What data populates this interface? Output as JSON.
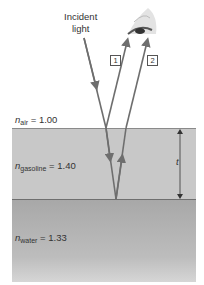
{
  "diagram": {
    "incident_label": [
      "Incident",
      "light"
    ],
    "ray_labels": [
      "1",
      "2"
    ],
    "thickness_label": "t",
    "media": [
      {
        "name": "air",
        "symbol": "n",
        "subscript": "air",
        "value": "= 1.00"
      },
      {
        "name": "gasoline",
        "symbol": "n",
        "subscript": "gasoline",
        "value": "= 1.40"
      },
      {
        "name": "water",
        "symbol": "n",
        "subscript": "water",
        "value": "= 1.33"
      }
    ],
    "colors": {
      "ray": "#6e6e6e",
      "gasoline": "#c8c8c8",
      "water": "#b0b0b0"
    }
  }
}
